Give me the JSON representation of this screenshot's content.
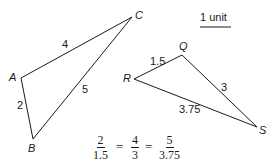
{
  "diagram": {
    "triangle1": {
      "vertices": {
        "A": "A",
        "B": "B",
        "C": "C"
      },
      "sides": {
        "AC": "4",
        "AB": "2",
        "BC": "5"
      }
    },
    "triangle2": {
      "vertices": {
        "Q": "Q",
        "R": "R",
        "S": "S"
      },
      "sides": {
        "RQ": "1.5",
        "QS": "3",
        "RS": "3.75"
      }
    },
    "scale": {
      "label": "1 unit"
    },
    "equation": {
      "f1": {
        "num": "2",
        "den": "1.5"
      },
      "f2": {
        "num": "4",
        "den": "3"
      },
      "f3": {
        "num": "5",
        "den": "3.75"
      },
      "eq": "="
    },
    "colors": {
      "stroke": "#1a1a1a",
      "background": "#ffffff"
    }
  }
}
